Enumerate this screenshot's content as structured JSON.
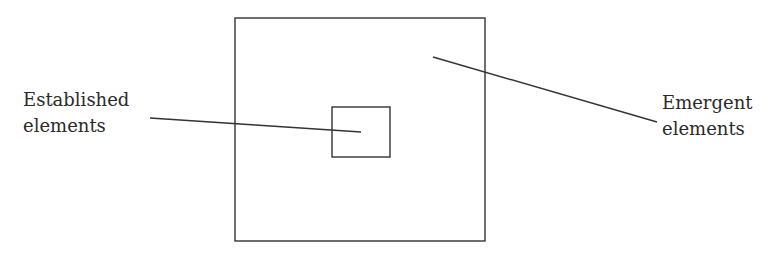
{
  "diagram": {
    "colors": {
      "stroke": "#333333",
      "text": "#2a2a2a",
      "background": "#ffffff"
    },
    "outer_box": {
      "x": 235,
      "y": 18,
      "width": 250,
      "height": 223,
      "represents": "Emergent elements"
    },
    "inner_box": {
      "x": 332,
      "y": 107,
      "width": 58,
      "height": 50,
      "represents": "Established elements"
    },
    "labels": {
      "established": {
        "line1": "Established",
        "line2": "elements"
      },
      "emergent": {
        "line1": "Emergent",
        "line2": "elements"
      }
    },
    "leader_lines": {
      "established": {
        "x1": 150,
        "y1": 118,
        "x2": 361,
        "y2": 132
      },
      "emergent": {
        "x1": 433,
        "y1": 57,
        "x2": 657,
        "y2": 122
      }
    }
  }
}
